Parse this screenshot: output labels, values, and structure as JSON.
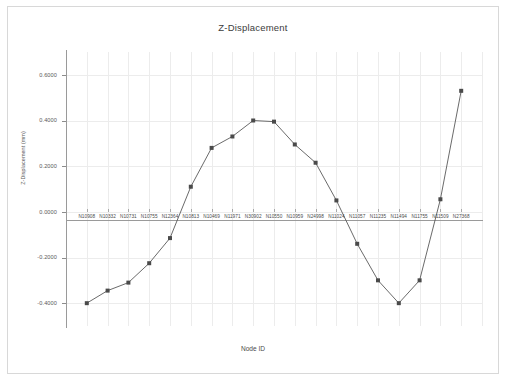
{
  "window": {
    "background_color": "#ffffff",
    "frame_color": "#d8d8d8"
  },
  "chart": {
    "title": "Z-Displacement",
    "xlabel": "Node ID",
    "ylabel": "Z-Displacement (mm)",
    "line_color": "#595959",
    "marker_color": "#4a4a4a",
    "grid_color": "#ececec",
    "axis_color": "#9a9a9a"
  },
  "chart_data": {
    "type": "line",
    "title": "Z-Displacement",
    "xlabel": "Node ID",
    "ylabel": "Z-Displacement (mm)",
    "ylim": [
      -0.5,
      0.7
    ],
    "yticks": [
      0.6,
      0.4,
      0.2,
      0.0,
      -0.2,
      -0.4
    ],
    "ytick_labels": [
      "0.6000",
      "0.4000",
      "0.2000",
      "0.0000",
      "-0.2000",
      "-0.4000"
    ],
    "grid": true,
    "legend": false,
    "categories": [
      "N10908",
      "N10332",
      "N10731",
      "N10755",
      "N12364",
      "N10813",
      "N10469",
      "N11971",
      "N30902",
      "N10550",
      "N10959",
      "N24998",
      "N11024",
      "N11057",
      "N11235",
      "N11494",
      "N11755",
      "N11509",
      "N27368"
    ],
    "series": [
      {
        "name": "Z-Displacement",
        "values": [
          -0.4,
          -0.345,
          -0.31,
          -0.225,
          -0.115,
          0.11,
          0.28,
          0.33,
          0.4,
          0.395,
          0.295,
          0.215,
          0.05,
          -0.14,
          -0.3,
          -0.4,
          -0.3,
          0.055,
          0.53
        ]
      }
    ]
  },
  "axis": {
    "x_tick_count": 19,
    "y_tick_count": 6
  }
}
